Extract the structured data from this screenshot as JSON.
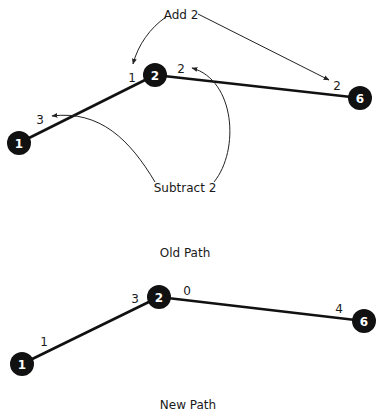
{
  "colors": {
    "node_fill": "#111111",
    "node_text": "#ffffff",
    "edge": "#111111",
    "text": "#1a1a1a",
    "background": "#ffffff"
  },
  "old_path": {
    "title": "Old Path",
    "nodes": [
      {
        "id": "1",
        "label": "1",
        "cx": 19,
        "cy": 143
      },
      {
        "id": "2",
        "label": "2",
        "cx": 155,
        "cy": 75
      },
      {
        "id": "6",
        "label": "6",
        "cx": 360,
        "cy": 98
      }
    ],
    "edges": [
      {
        "from": "1",
        "to": "2",
        "label_near_from": "3",
        "label_near_to": "1"
      },
      {
        "from": "2",
        "to": "6",
        "label_near_from": "2",
        "label_near_to": "2"
      }
    ],
    "annotations": {
      "add": {
        "text": "Add 2",
        "targets": [
          "label 1 at node 2",
          "label 2 at node 6"
        ]
      },
      "subtract": {
        "text": "Subtract 2",
        "targets": [
          "label 3 at node 1",
          "label 2 at node 2"
        ]
      }
    },
    "edge_labels": {
      "e12_near_1": "3",
      "e12_near_2": "1",
      "e26_near_2": "2",
      "e26_near_6": "2"
    }
  },
  "new_path": {
    "title": "New Path",
    "nodes": [
      {
        "id": "1",
        "label": "1",
        "cx": 22,
        "cy": 364
      },
      {
        "id": "2",
        "label": "2",
        "cx": 159,
        "cy": 297
      },
      {
        "id": "6",
        "label": "6",
        "cx": 364,
        "cy": 321
      }
    ],
    "edge_labels": {
      "e12_near_1": "1",
      "e12_near_2": "3",
      "e26_near_2": "0",
      "e26_near_6": "4"
    }
  }
}
